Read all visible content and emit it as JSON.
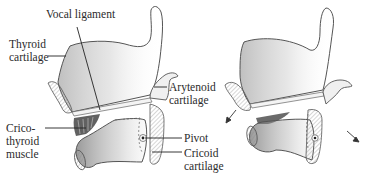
{
  "figure": {
    "left_panel": {
      "labels": {
        "vocal_ligament": "Vocal ligament",
        "thyroid_line1": "Thyroid",
        "thyroid_line2": "cartilage",
        "arytenoid_line1": "Arytenoid",
        "arytenoid_line2": "cartilage",
        "cricothyroid_line1": "Crico-",
        "cricothyroid_line2": "thyroid",
        "cricothyroid_line3": "muscle",
        "pivot": "Pivot",
        "cricoid_line1": "Cricoid",
        "cricoid_line2": "cartilage"
      }
    },
    "right_panel": {
      "arrows": [
        "down-left-arrow",
        "down-right-arrow"
      ]
    },
    "colors": {
      "outline": "#555555",
      "shading": "#9a9a9a",
      "text": "#2b2b2b",
      "background": "#ffffff"
    }
  }
}
